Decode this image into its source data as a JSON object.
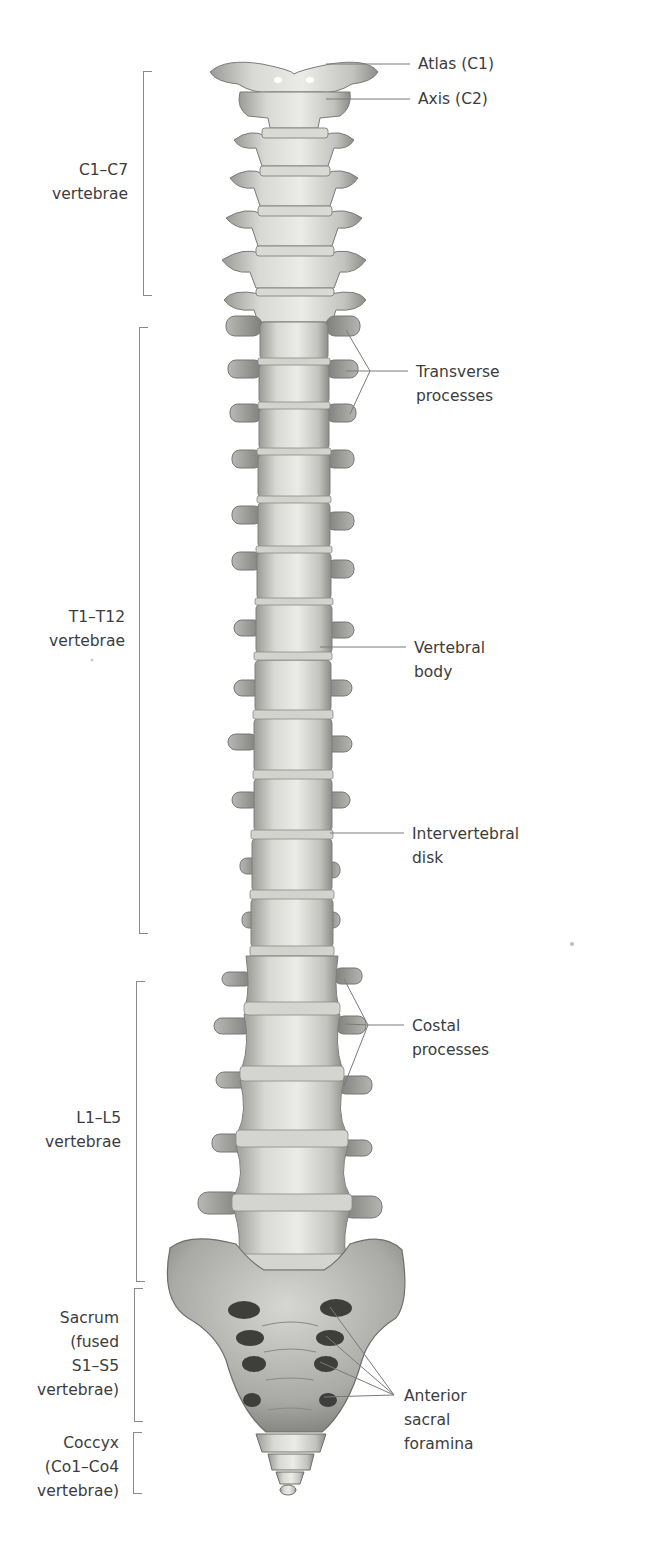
{
  "figure": {
    "colors": {
      "bone_light": "#e6e6e3",
      "bone_mid": "#c4c4c0",
      "bone_dark": "#8e8e8a",
      "line": "#7a7a7a",
      "text": "#3c3c3c"
    }
  },
  "regions": [
    {
      "id": "cervical",
      "lines": [
        "C1–C7",
        "vertebrae"
      ]
    },
    {
      "id": "thoracic",
      "lines": [
        "T1–T12",
        "vertebrae"
      ]
    },
    {
      "id": "lumbar",
      "lines": [
        "L1–L5",
        "vertebrae"
      ]
    },
    {
      "id": "sacrum",
      "lines": [
        "Sacrum",
        "(fused",
        "S1–S5",
        "vertebrae)"
      ]
    },
    {
      "id": "coccyx",
      "lines": [
        "Coccyx",
        "(Co1–Co4",
        "vertebrae)"
      ]
    }
  ],
  "callouts": [
    {
      "id": "atlas",
      "lines": [
        "Atlas (C1)"
      ]
    },
    {
      "id": "axis",
      "lines": [
        "Axis (C2)"
      ]
    },
    {
      "id": "transverse",
      "lines": [
        "Transverse",
        "processes"
      ]
    },
    {
      "id": "vertebral-body",
      "lines": [
        "Vertebral",
        "body"
      ]
    },
    {
      "id": "disk",
      "lines": [
        "Intervertebral",
        "disk"
      ]
    },
    {
      "id": "costal",
      "lines": [
        "Costal",
        "processes"
      ]
    },
    {
      "id": "foramina",
      "lines": [
        "Anterior",
        "sacral",
        "foramina"
      ]
    }
  ]
}
